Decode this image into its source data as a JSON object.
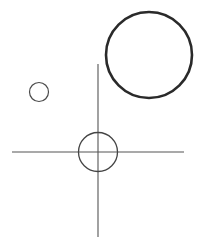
{
  "diagram": {
    "background": "#ffffff",
    "large_circle": {
      "cx": 149,
      "cy": 55,
      "r": 43,
      "stroke": "#2a2a2a",
      "stroke_width": 2.6
    },
    "small_circle": {
      "cx": 39,
      "cy": 92,
      "r": 9.5,
      "stroke": "#4a4a4a",
      "stroke_width": 1.2
    },
    "center_circle": {
      "cx": 98,
      "cy": 152,
      "r": 19.5,
      "stroke": "#444444",
      "stroke_width": 1.3
    },
    "crosshair_vertical": {
      "x1": 98,
      "y1": 64,
      "x2": 98,
      "y2": 237,
      "stroke": "#555555",
      "stroke_width": 1.1
    },
    "crosshair_horizontal": {
      "x1": 12,
      "y1": 152,
      "x2": 184,
      "y2": 152,
      "stroke": "#555555",
      "stroke_width": 1.1
    }
  }
}
